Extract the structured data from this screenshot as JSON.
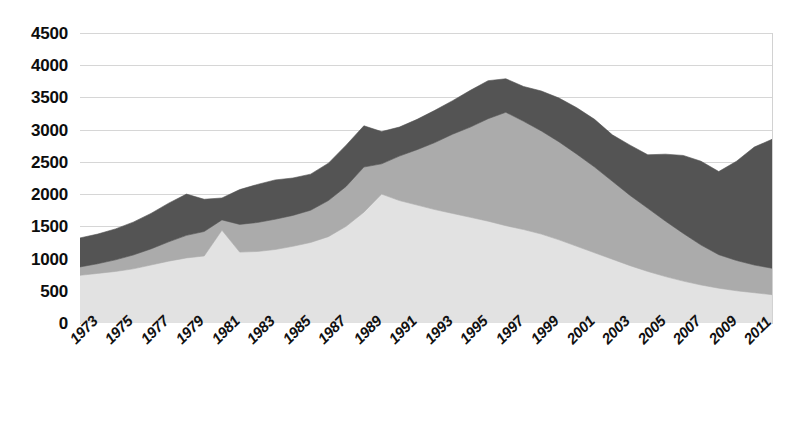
{
  "chart_data": {
    "type": "area",
    "stacked": true,
    "title": "",
    "subtitle": "",
    "xlabel": "",
    "ylabel": "",
    "ylim": [
      0,
      4500
    ],
    "ytick_step": 500,
    "yticks": [
      4500,
      4000,
      3500,
      3000,
      2500,
      2000,
      1500,
      1000,
      500,
      0
    ],
    "grid": true,
    "legend": "none",
    "xlabel_rotation": -45,
    "x_tick_labels": [
      "1973",
      "1975",
      "1977",
      "1979",
      "1981",
      "1983",
      "1985",
      "1987",
      "1989",
      "1991",
      "1993",
      "1995",
      "1997",
      "1999",
      "2001",
      "2003",
      "2005",
      "2007",
      "2009",
      "2011"
    ],
    "x": [
      1973,
      1974,
      1975,
      1976,
      1977,
      1978,
      1979,
      1980,
      1981,
      1982,
      1983,
      1984,
      1985,
      1986,
      1987,
      1988,
      1989,
      1990,
      1991,
      1992,
      1993,
      1994,
      1995,
      1996,
      1997,
      1998,
      1999,
      2000,
      2001,
      2002,
      2003,
      2004,
      2005,
      2006,
      2007,
      2008,
      2009,
      2010,
      2011,
      2012
    ],
    "colors": {
      "series_bottom": "#e2e2e2",
      "series_middle": "#ababab",
      "series_top": "#545454",
      "gridline": "#d6d6d6",
      "axis": "#c9c9c9",
      "text": "#0d0d0d",
      "background": "#ffffff"
    },
    "series": [
      {
        "name": "series-bottom",
        "color": "#e2e2e2",
        "values": [
          740,
          770,
          800,
          840,
          900,
          960,
          1010,
          1040,
          1440,
          1100,
          1110,
          1140,
          1190,
          1250,
          1340,
          1500,
          1720,
          2000,
          1900,
          1830,
          1760,
          1700,
          1640,
          1580,
          1510,
          1450,
          1380,
          1290,
          1190,
          1090,
          990,
          890,
          800,
          720,
          650,
          590,
          540,
          500,
          470,
          440
        ]
      },
      {
        "name": "series-middle",
        "color": "#ababab",
        "values": [
          130,
          150,
          180,
          215,
          250,
          300,
          350,
          380,
          160,
          430,
          450,
          470,
          480,
          500,
          560,
          620,
          700,
          470,
          690,
          860,
          1040,
          1230,
          1400,
          1590,
          1760,
          1680,
          1600,
          1520,
          1430,
          1330,
          1210,
          1090,
          980,
          860,
          740,
          620,
          520,
          470,
          430,
          410
        ]
      },
      {
        "name": "series-top",
        "color": "#545454",
        "values": [
          450,
          460,
          480,
          510,
          550,
          600,
          640,
          500,
          340,
          540,
          590,
          610,
          580,
          560,
          580,
          640,
          640,
          500,
          450,
          470,
          500,
          520,
          570,
          590,
          520,
          540,
          620,
          680,
          720,
          740,
          720,
          780,
          830,
          1040,
          1210,
          1300,
          1290,
          1540,
          1830,
          2000
        ]
      }
    ],
    "totals": [
      1320,
      1380,
      1460,
      1565,
      1700,
      1860,
      2000,
      1920,
      1940,
      2070,
      2150,
      2220,
      2250,
      2310,
      2480,
      2760,
      3060,
      2970,
      3040,
      3160,
      3300,
      3450,
      3610,
      3760,
      3790,
      3670,
      3600,
      3490,
      3340,
      3160,
      2920,
      2760,
      2610,
      2620,
      2600,
      2510,
      2350,
      2510,
      2730,
      2850
    ]
  }
}
